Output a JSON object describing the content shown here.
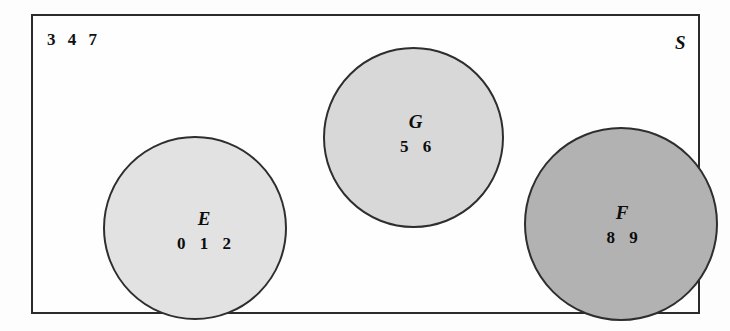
{
  "diagram": {
    "type": "set-diagram",
    "universe": {
      "label": "S",
      "outside_elements": "3 4 7"
    },
    "sets": [
      {
        "name": "E",
        "members": "0 1 2",
        "fill": "#e2e2e2"
      },
      {
        "name": "G",
        "members": "5 6",
        "fill": "#d8d8d8"
      },
      {
        "name": "F",
        "members": "8 9",
        "fill": "#b2b2b2"
      }
    ]
  }
}
